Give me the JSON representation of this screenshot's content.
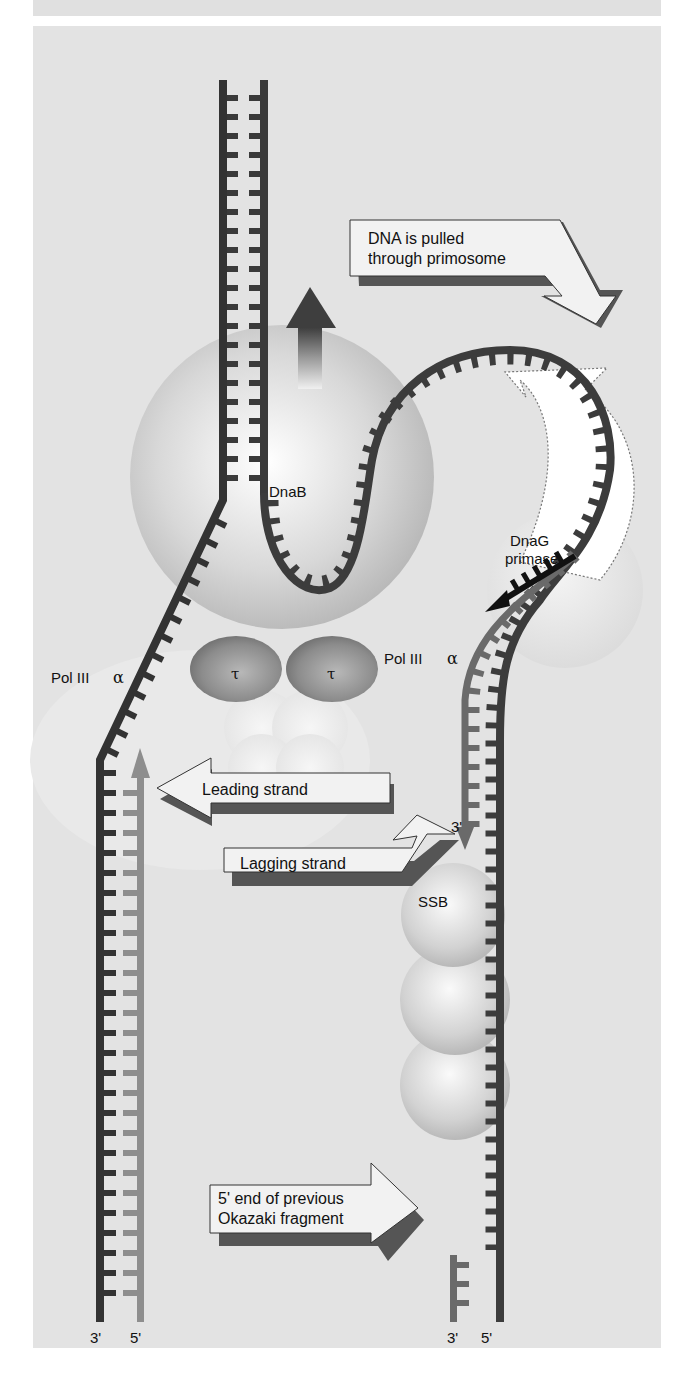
{
  "figure": {
    "topic": "E. coli replisome at the replication fork",
    "colors": {
      "background": "#e3e3e3",
      "strand_dark": "#3a3a3a",
      "strand_mid": "#5a5a5a",
      "new_strand_light": "#8e8e8e",
      "primer": "#111111"
    }
  },
  "labels": {
    "dnab": "DnaB",
    "dnag_line1": "DnaG",
    "dnag_line2": "primase",
    "pol3_left": "Pol III",
    "pol3_left_greek": "α",
    "pol3_right": "Pol III",
    "pol3_right_greek": "α",
    "tau_left": "τ",
    "tau_right": "τ",
    "ssb": "SSB",
    "lag_3prime": "3'"
  },
  "callouts": {
    "pulled_line1": "DNA is pulled",
    "pulled_line2": "through primosome",
    "leading": "Leading strand",
    "lagging": "Lagging strand",
    "okazaki_line1": "5' end of previous",
    "okazaki_line2": "Okazaki fragment"
  },
  "ends": {
    "left_a": "3'",
    "left_b": "5'",
    "right_a": "3'",
    "right_b": "5'"
  }
}
